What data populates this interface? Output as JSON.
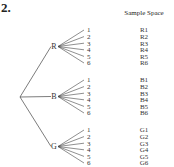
{
  "problem_number": "2.",
  "sample_space_header": "Sample Space",
  "tree": {
    "branches": [
      {
        "label": "R",
        "outcomes": [
          "1",
          "2",
          "3",
          "4",
          "5",
          "6"
        ],
        "sample_space": [
          "R1",
          "R2",
          "R3",
          "R4",
          "R5",
          "R6"
        ]
      },
      {
        "label": "B",
        "outcomes": [
          "1",
          "2",
          "3",
          "4",
          "5",
          "6"
        ],
        "sample_space": [
          "B1",
          "B2",
          "B3",
          "B4",
          "B5",
          "B6"
        ]
      },
      {
        "label": "G",
        "outcomes": [
          "1",
          "2",
          "3",
          "4",
          "5",
          "6"
        ],
        "sample_space": [
          "G1",
          "G2",
          "G3",
          "G4",
          "G5",
          "G6"
        ]
      }
    ]
  }
}
